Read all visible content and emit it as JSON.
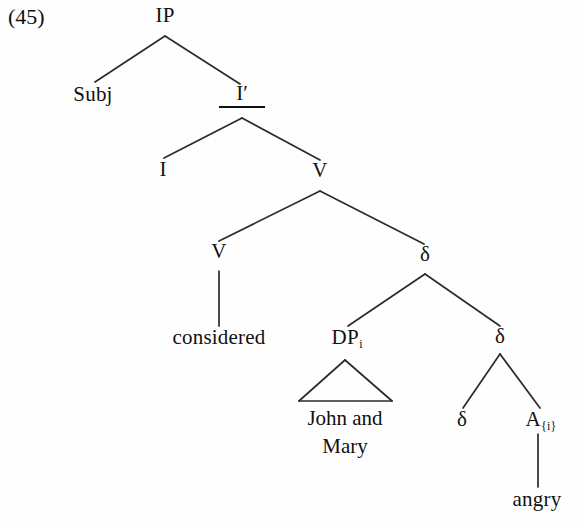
{
  "figure": {
    "example_number": "(45)",
    "type": "syntax-tree",
    "ink_color": "#111111",
    "background_color": "#fefefe"
  },
  "nodes": {
    "ip": "IP",
    "subj": "Subj",
    "i_bar_label": "I",
    "i_bar_prime": "′",
    "i_head": "I",
    "v_upper": "V",
    "v_lower": "V",
    "considered": "considered",
    "delta_top": "δ",
    "dp": "DP",
    "dp_sub": "i",
    "john_and_mary_line1": "John and",
    "john_and_mary_line2": "Mary",
    "delta_mid": "δ",
    "delta_leaf": "δ",
    "a_head": "A",
    "a_sub": "{i}",
    "angry": "angry"
  },
  "tree_structure": {
    "root": "IP",
    "edges": [
      [
        "IP",
        "Subj"
      ],
      [
        "IP",
        "I′"
      ],
      [
        "I′",
        "I"
      ],
      [
        "I′",
        "V"
      ],
      [
        "V",
        "V"
      ],
      [
        "V",
        "δ"
      ],
      [
        "V",
        "considered"
      ],
      [
        "δ",
        "DP_i"
      ],
      [
        "δ",
        "δ"
      ],
      [
        "DP_i",
        "John and Mary"
      ],
      [
        "δ",
        "δ"
      ],
      [
        "δ",
        "A_{i}"
      ],
      [
        "A_{i}",
        "angry"
      ]
    ]
  }
}
